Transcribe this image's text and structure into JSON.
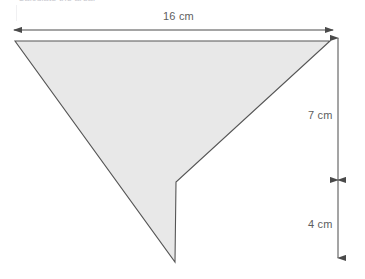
{
  "page": {
    "width": 365,
    "height": 279,
    "background": "#ffffff"
  },
  "caption": {
    "text": "Calculate the area.",
    "note": "clipped at top edge of screenshot"
  },
  "diagram": {
    "name": "arrowhead-dart-quadrilateral",
    "fill_color": "#e8e8e8",
    "stroke_color": "#555555",
    "dimension_color": "#5e5e5e",
    "shape_points": "15,41 330,41 176,182 175,262",
    "vertices": [
      {
        "name": "left-tip",
        "x": 15,
        "y": 41
      },
      {
        "name": "right-tip",
        "x": 330,
        "y": 41
      },
      {
        "name": "inner-notch",
        "x": 176,
        "y": 182
      },
      {
        "name": "bottom-tip",
        "x": 175,
        "y": 262
      }
    ]
  },
  "dimensions": {
    "width": {
      "label": "16 cm",
      "value": 16,
      "unit": "cm",
      "orientation": "horizontal",
      "from_x": 14,
      "to_x": 333,
      "y": 30
    },
    "upper_height": {
      "label": "7 cm",
      "value": 7,
      "unit": "cm",
      "orientation": "vertical",
      "x": 338,
      "from_y": 38,
      "to_y": 180
    },
    "lower_height": {
      "label": "4 cm",
      "value": 4,
      "unit": "cm",
      "orientation": "vertical",
      "x": 338,
      "from_y": 180,
      "to_y": 258
    }
  }
}
